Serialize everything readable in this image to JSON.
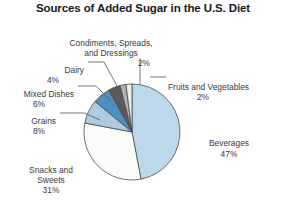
{
  "chart_data": {
    "type": "pie",
    "title": "Sources of Added Sugar in the U.S. Diet",
    "xlabel": "",
    "ylabel": "",
    "legend": "none",
    "grid": false,
    "units": "percent",
    "total": 100,
    "categories": [
      "Beverages",
      "Snacks and Sweets",
      "Grains",
      "Mixed Dishes",
      "Dairy",
      "Condiments, Spreads, and Dressings",
      "Fruits and Vegetables"
    ],
    "values": [
      47,
      31,
      8,
      6,
      4,
      2,
      2
    ],
    "colors": [
      "#bcd9ec",
      "#fbfbf9",
      "#aecbe2",
      "#4d8fc0",
      "#5a5a5a",
      "#b0b0b0",
      "#efeee6"
    ],
    "slices": [
      {
        "name": "Beverages",
        "value": 47,
        "label": "Beverages",
        "pct": "47%",
        "color": "#bcd9ec"
      },
      {
        "name": "Snacks and Sweets",
        "value": 31,
        "label": "Snacks and\nSweets",
        "pct": "31%",
        "color": "#fbfbf9"
      },
      {
        "name": "Grains",
        "value": 8,
        "label": "Grains",
        "pct": "8%",
        "color": "#aecbe2"
      },
      {
        "name": "Mixed Dishes",
        "value": 6,
        "label": "Mixed Dishes",
        "pct": "6%",
        "color": "#4d8fc0"
      },
      {
        "name": "Dairy",
        "value": 4,
        "label": "Dairy",
        "pct": "4%",
        "color": "#5a5a5a"
      },
      {
        "name": "Condiments, Spreads, and Dressings",
        "value": 2,
        "label": "Condiments, Spreads,\nand Dressings",
        "pct": "2%",
        "color": "#b0b0b0"
      },
      {
        "name": "Fruits and Vegetables",
        "value": 2,
        "label": "Fruits and Vegetables",
        "pct": "2%",
        "color": "#efeee6"
      }
    ]
  },
  "labels": {
    "beverages": {
      "name": "Beverages",
      "pct": "47%"
    },
    "snacks": {
      "name": "Snacks and\nSweets",
      "pct": "31%"
    },
    "grains": {
      "name": "Grains",
      "pct": "8%"
    },
    "mixed": {
      "name": "Mixed Dishes",
      "pct": "6%"
    },
    "dairy": {
      "name": "Dairy",
      "pct": "4%"
    },
    "condiments": {
      "name": "Condiments, Spreads,\nand Dressings",
      "pct": "2%"
    },
    "fruits": {
      "name": "Fruits and Vegetables",
      "pct": "2%"
    }
  }
}
